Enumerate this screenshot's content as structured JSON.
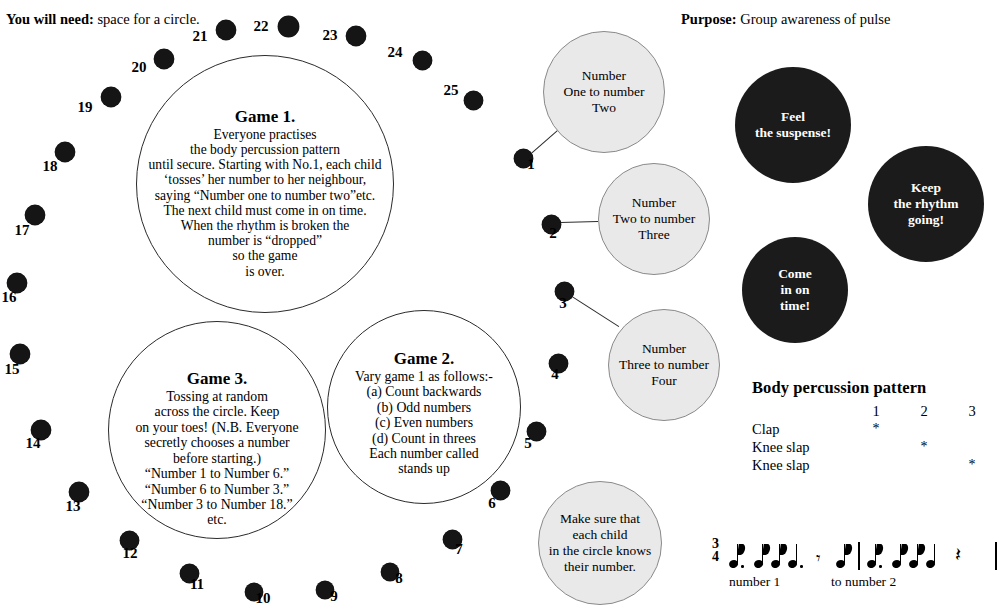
{
  "header": {
    "you_will_need_label": "You will need:",
    "you_will_need_value": "space for a circle.",
    "purpose_label": "Purpose:",
    "purpose_value": "Group awareness of pulse"
  },
  "colors": {
    "dot_fill": "#151515",
    "gray_circle_fill": "#e9e9e9",
    "gray_circle_stroke": "#8a8a8a",
    "dark_circle_fill": "#1b1b1b",
    "dark_circle_text": "#ffffff",
    "outline_stroke": "#2b2b2b"
  },
  "participants": [
    {
      "number": "1",
      "cx": 523,
      "cy": 158,
      "r": 9.5,
      "nx": 531,
      "ny": 164
    },
    {
      "number": "2",
      "cx": 551,
      "cy": 224,
      "r": 9.5,
      "nx": 553,
      "ny": 233
    },
    {
      "number": "3",
      "cx": 564,
      "cy": 291,
      "r": 9.5,
      "nx": 563,
      "ny": 303
    },
    {
      "number": "4",
      "cx": 558,
      "cy": 363,
      "r": 9.5,
      "nx": 555,
      "ny": 374
    },
    {
      "number": "5",
      "cx": 536,
      "cy": 431,
      "r": 9.5,
      "nx": 528,
      "ny": 443
    },
    {
      "number": "6",
      "cx": 500,
      "cy": 490,
      "r": 9.5,
      "nx": 492,
      "ny": 503
    },
    {
      "number": "7",
      "cx": 452,
      "cy": 539,
      "r": 9.5,
      "nx": 459,
      "ny": 549
    },
    {
      "number": "8",
      "cx": 390,
      "cy": 572,
      "r": 9,
      "nx": 399,
      "ny": 578
    },
    {
      "number": "9",
      "cx": 325,
      "cy": 590,
      "r": 9,
      "nx": 334,
      "ny": 596
    },
    {
      "number": "10",
      "cx": 254,
      "cy": 592,
      "r": 9,
      "nx": 263,
      "ny": 598
    },
    {
      "number": "11",
      "cx": 189,
      "cy": 573,
      "r": 9.5,
      "nx": 197,
      "ny": 584
    },
    {
      "number": "12",
      "cx": 129,
      "cy": 540,
      "r": 9.5,
      "nx": 130,
      "ny": 553
    },
    {
      "number": "13",
      "cx": 79,
      "cy": 492,
      "r": 10,
      "nx": 73,
      "ny": 506
    },
    {
      "number": "14",
      "cx": 41,
      "cy": 430,
      "r": 10,
      "nx": 33,
      "ny": 443
    },
    {
      "number": "15",
      "cx": 20,
      "cy": 354,
      "r": 10,
      "nx": 12,
      "ny": 369
    },
    {
      "number": "16",
      "cx": 17,
      "cy": 283,
      "r": 10,
      "nx": 9,
      "ny": 297
    },
    {
      "number": "17",
      "cx": 35,
      "cy": 215,
      "r": 10,
      "nx": 22,
      "ny": 230
    },
    {
      "number": "18",
      "cx": 65,
      "cy": 152,
      "r": 10,
      "nx": 50,
      "ny": 166
    },
    {
      "number": "19",
      "cx": 111,
      "cy": 97,
      "r": 10,
      "nx": 85,
      "ny": 107
    },
    {
      "number": "20",
      "cx": 164,
      "cy": 59,
      "r": 10,
      "nx": 139,
      "ny": 67
    },
    {
      "number": "21",
      "cx": 226,
      "cy": 30,
      "r": 10,
      "nx": 200,
      "ny": 36
    },
    {
      "number": "22",
      "cx": 288,
      "cy": 26,
      "r": 10.5,
      "nx": 261,
      "ny": 26
    },
    {
      "number": "23",
      "cx": 356,
      "cy": 36,
      "r": 10,
      "nx": 330,
      "ny": 35
    },
    {
      "number": "24",
      "cx": 422,
      "cy": 60,
      "r": 9.5,
      "nx": 395,
      "ny": 52
    },
    {
      "number": "25",
      "cx": 473,
      "cy": 100,
      "r": 9.5,
      "nx": 451,
      "ny": 90
    }
  ],
  "game_circles": [
    {
      "id": "game-1",
      "title": "Game 1.",
      "cx": 265,
      "cy": 184,
      "r": 129,
      "lines": [
        "Everyone practises",
        "the body percussion pattern",
        "until secure. Starting with No.1, each child",
        "‘tosses’ her number to her neighbour,",
        "saying “Number one to number two”etc.",
        "The next child must come in on time.",
        "When the rhythm is broken the",
        "number is “dropped”",
        "so the game",
        "is over."
      ]
    },
    {
      "id": "game-3",
      "title": "Game 3.",
      "cx": 217,
      "cy": 430,
      "r": 109,
      "lines": [
        "Tossing at random",
        "across the circle. Keep",
        "on your toes! (N.B. Everyone",
        "secretly chooses a number",
        "before starting.)",
        "“Number 1 to Number 6.”",
        "“Number 6 to Number 3.”",
        "“Number 3 to Number 18.”",
        "etc."
      ]
    },
    {
      "id": "game-2",
      "title": "Game 2.",
      "cx": 424,
      "cy": 407,
      "r": 97,
      "lines": [
        "Vary game 1 as follows:-",
        "(a)  Count backwards",
        "(b)  Odd numbers",
        "(c)  Even numbers",
        "(d)  Count in threes",
        "Each number called",
        "stands up"
      ]
    }
  ],
  "speech_circles": [
    {
      "id": "speech-one-to-two",
      "cx": 604,
      "cy": 92,
      "r": 61,
      "lines": [
        "Number",
        "One to number",
        "Two"
      ],
      "connector": {
        "x1": 531,
        "y1": 153,
        "x2": 563,
        "y2": 125
      }
    },
    {
      "id": "speech-two-to-three",
      "cx": 654,
      "cy": 219,
      "r": 56,
      "lines": [
        "Number",
        "Two to number",
        "Three"
      ],
      "connector": {
        "x1": 560,
        "y1": 222,
        "x2": 598,
        "y2": 221
      }
    },
    {
      "id": "speech-three-to-four",
      "cx": 664,
      "cy": 365,
      "r": 56,
      "lines": [
        "Number",
        "Three to number",
        "Four"
      ],
      "connector": {
        "x1": 572,
        "y1": 296,
        "x2": 619,
        "y2": 326
      }
    },
    {
      "id": "speech-know-number",
      "cx": 600,
      "cy": 543,
      "r": 62,
      "lines": [
        "Make sure that",
        "each child",
        "in the circle knows",
        "their number."
      ],
      "connector": null
    }
  ],
  "dark_circles": [
    {
      "id": "feel-the-suspense",
      "cx": 793,
      "cy": 125,
      "r": 58,
      "lines": [
        "Feel",
        "the suspense!"
      ]
    },
    {
      "id": "keep-rhythm-going",
      "cx": 926,
      "cy": 204,
      "r": 58,
      "lines": [
        "Keep",
        "the rhythm",
        "going!"
      ]
    },
    {
      "id": "come-in-on-time",
      "cx": 795,
      "cy": 290,
      "r": 53,
      "lines": [
        "Come",
        "in on",
        "time!"
      ]
    }
  ],
  "body_percussion": {
    "heading": "Body percussion pattern",
    "beats": [
      "1",
      "2",
      "3"
    ],
    "rows": [
      {
        "label": "Clap",
        "marks": [
          "*",
          "",
          ""
        ]
      },
      {
        "label": "Knee slap",
        "marks": [
          "",
          "*",
          ""
        ]
      },
      {
        "label": "Knee slap",
        "marks": [
          "",
          "",
          "*"
        ]
      }
    ]
  },
  "music": {
    "time_signature_top": "3",
    "time_signature_bottom": "4",
    "caption_1": "number 1",
    "caption_2": "to number 2",
    "symbols": [
      "eighth-note-dotted",
      "eighth-note",
      "eighth-note",
      "quarter-note-dotted",
      "eighth-rest",
      "eighth-note",
      "barline",
      "eighth-note-dotted",
      "eighth-note",
      "eighth-note",
      "quarter-note",
      "quarter-rest",
      "barline"
    ]
  }
}
